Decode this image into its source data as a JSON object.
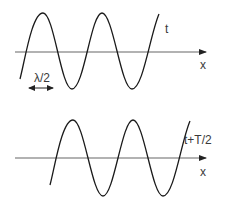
{
  "diagram": {
    "colors": {
      "wave": "#1a1a1a",
      "axis": "#555555",
      "text": "#3a3a3a"
    },
    "top_panel": {
      "time_label": "t",
      "axis_label": "x",
      "wavelength_marker_label": "λ/2"
    },
    "bottom_panel": {
      "time_label": "t+T/2",
      "axis_label": "x"
    }
  }
}
